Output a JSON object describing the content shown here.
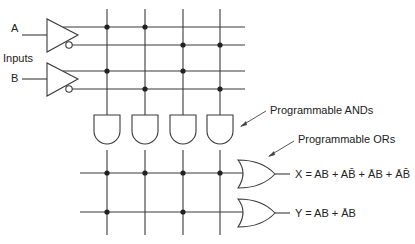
{
  "diagram": {
    "inputs_label": "Inputs",
    "inputs": [
      {
        "name": "A",
        "true_line": "A",
        "complement_line": "Ā"
      },
      {
        "name": "B",
        "true_line": "B",
        "complement_line": "B̄"
      }
    ],
    "input_lines": [
      "A",
      "Ā",
      "B",
      "B̄"
    ],
    "and_gates": [
      {
        "id": "and1",
        "product": "AB",
        "connections": [
          "A",
          "B"
        ]
      },
      {
        "id": "and2",
        "product": "AB̄",
        "connections": [
          "A",
          "B̄"
        ]
      },
      {
        "id": "and3",
        "product": "ĀB",
        "connections": [
          "Ā",
          "B"
        ]
      },
      {
        "id": "and4",
        "product": "ĀB̄",
        "connections": [
          "Ā",
          "B̄"
        ]
      }
    ],
    "or_gates": [
      {
        "id": "orX",
        "output": "X",
        "equation": "X = AB + AB̄ + ĀB + ĀB̄",
        "connections": [
          "and1",
          "and2",
          "and3",
          "and4"
        ]
      },
      {
        "id": "orY",
        "output": "Y",
        "equation": "Y = AB + ĀB",
        "connections": [
          "and1",
          "and3"
        ]
      }
    ],
    "annotations": {
      "ands": "Programmable ANDs",
      "ors": "Programmable ORs"
    }
  }
}
